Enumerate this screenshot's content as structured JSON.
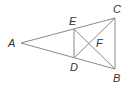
{
  "diagram": {
    "type": "geometry-figure",
    "stroke_color": "#8a8a8a",
    "label_color": "#333333",
    "points": [
      {
        "name": "A",
        "x": 21,
        "y": 43,
        "label_x": 8,
        "label_y": 47
      },
      {
        "name": "E",
        "x": 74,
        "y": 29,
        "label_x": 69,
        "label_y": 25
      },
      {
        "name": "D",
        "x": 74,
        "y": 58,
        "label_x": 70,
        "label_y": 71
      },
      {
        "name": "C",
        "x": 115,
        "y": 18,
        "label_x": 113,
        "label_y": 13
      },
      {
        "name": "B",
        "x": 115,
        "y": 69,
        "label_x": 113,
        "label_y": 82
      },
      {
        "name": "F",
        "x": 94,
        "y": 43,
        "label_x": 96,
        "label_y": 47
      }
    ],
    "segments": [
      {
        "from": "A",
        "to": "C"
      },
      {
        "from": "A",
        "to": "B"
      },
      {
        "from": "C",
        "to": "B"
      },
      {
        "from": "E",
        "to": "D"
      },
      {
        "from": "E",
        "to": "B"
      },
      {
        "from": "D",
        "to": "C"
      }
    ],
    "labels": {
      "A": "A",
      "B": "B",
      "C": "C",
      "D": "D",
      "E": "E",
      "F": "F"
    }
  }
}
